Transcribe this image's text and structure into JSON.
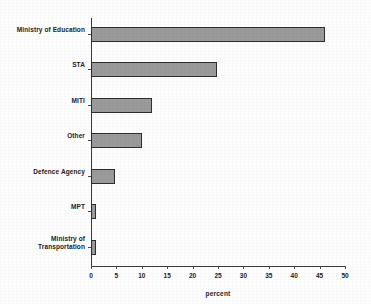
{
  "chart_data": {
    "type": "bar",
    "orientation": "horizontal",
    "title": "",
    "xlabel": "percent",
    "ylabel": "",
    "xlim": [
      0,
      50
    ],
    "xticks": [
      0,
      5,
      10,
      15,
      20,
      25,
      30,
      35,
      40,
      45,
      50
    ],
    "xtick_labels": [
      "0",
      "5",
      "10",
      "15",
      "20",
      "25",
      "30",
      "35",
      "40",
      "45",
      "50"
    ],
    "grid": false,
    "legend": null,
    "categories": [
      "Ministry of Education",
      "STA",
      "MITI",
      "Other",
      "Defence Agency",
      "MPT",
      "Ministry of Transportation"
    ],
    "values": [
      46.0,
      24.8,
      12.0,
      10.0,
      4.7,
      0.9,
      0.9
    ],
    "bar_fill_color": "#9a9a9a",
    "bar_border_color": "#2e2e2e",
    "axis_color": "#3a3a3a",
    "background_color": "#fdfdfd"
  },
  "category_labels": [
    {
      "line1": "Ministry of Education",
      "line2": ""
    },
    {
      "line1": "STA",
      "line2": ""
    },
    {
      "line1": "MITI",
      "line2": ""
    },
    {
      "line1": "Other",
      "line2": ""
    },
    {
      "line1": "Defence Agency",
      "line2": ""
    },
    {
      "line1": "MPT",
      "line2": ""
    },
    {
      "line1": "Ministry of",
      "line2": "Transportation"
    }
  ]
}
